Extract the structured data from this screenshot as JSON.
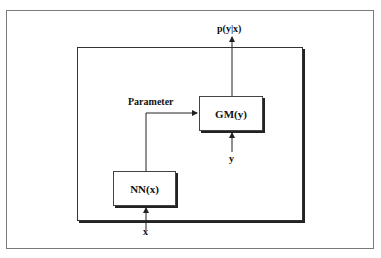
{
  "diagram": {
    "output_label": "p(y|x)",
    "parameter_label": "Parameter",
    "blocks": [
      {
        "id": "gm",
        "label": "GM(y)"
      },
      {
        "id": "nn",
        "label": "NN(x)"
      }
    ],
    "inputs": {
      "x": "x",
      "y": "y"
    },
    "colors": {
      "line": "#222222",
      "frame": "#7a7a7a",
      "background": "#ffffff"
    }
  }
}
